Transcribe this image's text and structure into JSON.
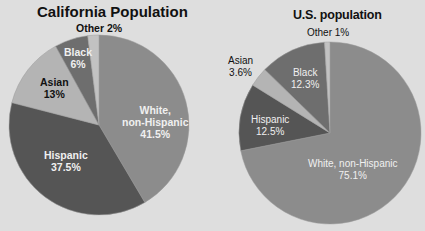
{
  "chart_data": [
    {
      "type": "pie",
      "title": "California Population",
      "slices": [
        {
          "label": "White, non-Hispanic",
          "value": 41.5,
          "display": "41.5%",
          "color": "#8c8c8c"
        },
        {
          "label": "Hispanic",
          "value": 37.5,
          "display": "37.5%",
          "color": "#555555"
        },
        {
          "label": "Asian",
          "value": 13,
          "display": "13%",
          "color": "#b4b4b4"
        },
        {
          "label": "Black",
          "value": 6,
          "display": "6%",
          "color": "#6e6e6e"
        },
        {
          "label": "Other",
          "value": 2,
          "display": "2%",
          "color": "#c2c2c2"
        }
      ]
    },
    {
      "type": "pie",
      "title": "U.S. population",
      "slices": [
        {
          "label": "White, non-Hispanic",
          "value": 75.1,
          "display": "75.1%",
          "color": "#8c8c8c"
        },
        {
          "label": "Hispanic",
          "value": 12.5,
          "display": "12.5%",
          "color": "#555555"
        },
        {
          "label": "Asian",
          "value": 3.6,
          "display": "3.6%",
          "color": "#b4b4b4"
        },
        {
          "label": "Black",
          "value": 12.3,
          "display": "12.3%",
          "color": "#6e6e6e"
        },
        {
          "label": "Other",
          "value": 1,
          "display": "1%",
          "color": "#c2c2c2"
        }
      ]
    }
  ],
  "labels": {
    "ca": {
      "title": "California Population",
      "other": "Other 2%",
      "black_name": "Black",
      "black_val": "6%",
      "asian_name": "Asian",
      "asian_val": "13%",
      "white_name1": "White,",
      "white_name2": "non-Hispanic",
      "white_val": "41.5%",
      "hispanic_name": "Hispanic",
      "hispanic_val": "37.5%"
    },
    "us": {
      "title": "U.S. population",
      "other": "Other 1%",
      "asian_name": "Asian",
      "asian_val": "3.6%",
      "black_name": "Black",
      "black_val": "12.3%",
      "hispanic_name": "Hispanic",
      "hispanic_val": "12.5%",
      "white_name": "White, non-Hispanic",
      "white_val": "75.1%"
    }
  }
}
